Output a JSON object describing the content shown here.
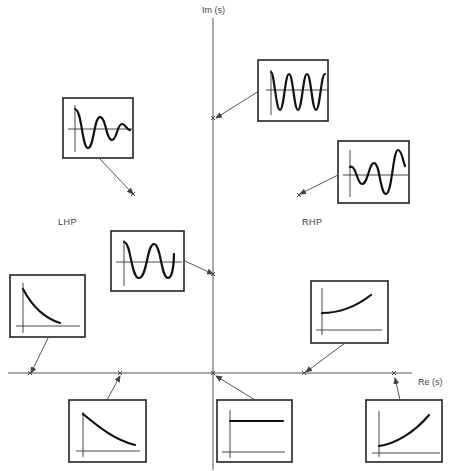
{
  "diagram": {
    "axes": {
      "imaginary_label": "Im (s)",
      "real_label": "Re (s)"
    },
    "regions": {
      "left": "LHP",
      "right": "RHP"
    },
    "poles": [
      {
        "id": "p1",
        "location": "imaginary axis, high frequency",
        "response": "sustained oscillation (high frequency)"
      },
      {
        "id": "p2",
        "location": "LHP, complex",
        "response": "damped oscillation"
      },
      {
        "id": "p3",
        "location": "RHP, complex",
        "response": "growing oscillation"
      },
      {
        "id": "p4",
        "location": "imaginary axis, low frequency",
        "response": "sustained oscillation (low frequency)"
      },
      {
        "id": "p5",
        "location": "real axis, far left",
        "response": "fast exponential decay"
      },
      {
        "id": "p6",
        "location": "real axis, near left",
        "response": "slow exponential decay"
      },
      {
        "id": "p7",
        "location": "origin",
        "response": "constant (step)"
      },
      {
        "id": "p8",
        "location": "real axis, near right",
        "response": "slow exponential growth"
      },
      {
        "id": "p9",
        "location": "real axis, far right",
        "response": "fast exponential growth"
      }
    ],
    "colors": {
      "axis": "#555555",
      "curve": "#111111",
      "box": "#222222",
      "background": "#ffffff"
    }
  }
}
